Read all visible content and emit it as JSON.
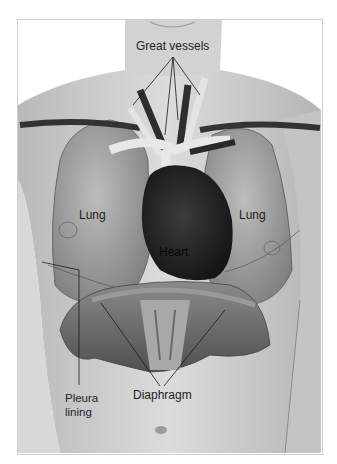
{
  "figure": {
    "labels": {
      "great_vessels": "Great vessels",
      "lung_left": "Lung",
      "lung_right": "Lung",
      "heart": "Heart",
      "pleura_line1": "Pleura",
      "pleura_line2": "lining",
      "diaphragm": "Diaphragm"
    },
    "colors": {
      "background": "#ffffff",
      "skin": "#cfcfcf",
      "lung": "#9a9a9a",
      "heart": "#2a2a2a",
      "vessels_light": "#e6e6e6",
      "vessels_dark": "#3a3a3a",
      "diaphragm": "#6e6e6e",
      "text": "#1e1e1e"
    }
  }
}
